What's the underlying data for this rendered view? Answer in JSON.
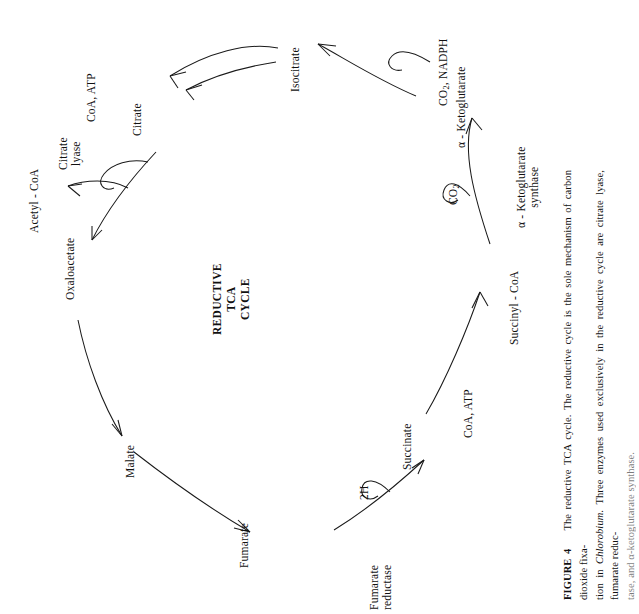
{
  "figure": {
    "title_lines": [
      "REDUCTIVE",
      "TCA",
      "CYCLE"
    ],
    "caption_label": "FIGURE  4",
    "caption_line1": "The reductive TCA cycle. The reductive cycle is the sole mechanism of carbon dioxide fixa-",
    "caption_line2_a": "tion in ",
    "caption_line2_italic": "Chlorobium.",
    "caption_line2_b": " Three enzymes used exclusively in the reductive cycle are citrate lyase, fumarate reduc-",
    "caption_line3": "tase, and α-ketoglutarate synthase."
  },
  "metabolites": [
    {
      "id": "isocitrate",
      "label": "Isocitrate"
    },
    {
      "id": "alpha-ketoglutarate",
      "label": "α - Ketoglutarate"
    },
    {
      "id": "succinyl-coa",
      "label": "Succinyl - CoA"
    },
    {
      "id": "succinate",
      "label": "Succinate"
    },
    {
      "id": "fumarate",
      "label": "Fumarate"
    },
    {
      "id": "malate",
      "label": "Malate"
    },
    {
      "id": "oxaloacetate",
      "label": "Oxaloacetate"
    },
    {
      "id": "acetyl-coa",
      "label": "Acetyl - CoA"
    },
    {
      "id": "citrate",
      "label": "Citrate"
    }
  ],
  "enzymes": [
    {
      "id": "citrate-lyase",
      "line1": "Citrate",
      "line2": "lyase"
    },
    {
      "id": "alpha-ketoglutarate-synthase",
      "line1": "α - Ketoglutarate",
      "line2": "synthase"
    },
    {
      "id": "fumarate-reductase",
      "line1": "Fumarate",
      "line2": "reductase"
    }
  ],
  "cofactors": [
    {
      "id": "co2-nadph",
      "label": "CO",
      "sub": "2",
      "tail": ", NADPH"
    },
    {
      "id": "co2",
      "label": "CO",
      "sub": "2",
      "tail": ""
    },
    {
      "id": "coa-atp-succinyl",
      "label": "CoA, ATP"
    },
    {
      "id": "two-h",
      "label": "2H"
    },
    {
      "id": "coa-atp-citrate",
      "label": "CoA, ATP"
    }
  ],
  "colors": {
    "ink": "#1a1a1a",
    "paper": "#ffffff"
  }
}
